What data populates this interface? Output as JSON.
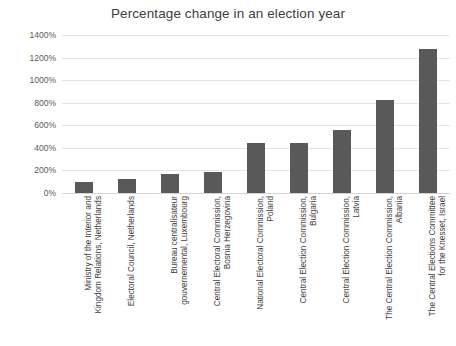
{
  "chart_data": {
    "type": "bar",
    "title": "Percentage change in an election year",
    "xlabel": "",
    "ylabel": "",
    "ylim": [
      0,
      1400
    ],
    "grid": true,
    "legend": false,
    "y_tick_labels": [
      "1400%",
      "1200%",
      "1000%",
      "800%",
      "600%",
      "400%",
      "200%",
      "0%"
    ],
    "y_ticks": [
      1400,
      1200,
      1000,
      800,
      600,
      400,
      200,
      0
    ],
    "bar_color": "#595959",
    "categories": [
      "Ministry of the Interior and Kingdom Relations, Netherlands",
      "Electoral Council, Netherlands",
      "Bureau centralisateur gouvernemental, Luxembourg",
      "Central Electoral Commission, Bosnia Herzegovina",
      "National Electoral Commission, Poland",
      "Central Election Commission, Bulgaria",
      "Central Election Commission, Latvia",
      "The Central Election Commission, Albania",
      "The Central Elections Committee for the Knesset, Israel"
    ],
    "category_lines": [
      "Ministry of the Interior and\nKingdom Relations, Netherlands",
      "Electoral Council, Netherlands",
      "Bureau centralisateur\ngouvernemental, Luxembourg",
      "Central Electoral Commission,\nBosnia Herzegovina",
      "National Electoral Commission,\nPoland",
      "Central Election Commission,\nBulgaria",
      "Central Election Commission,\nLatvia",
      "The Central Election Commission,\nAlbania",
      "The Central Elections Committee\nfor the Knesset, Israel"
    ],
    "values": [
      100,
      120,
      170,
      190,
      445,
      445,
      560,
      820,
      1280
    ]
  }
}
